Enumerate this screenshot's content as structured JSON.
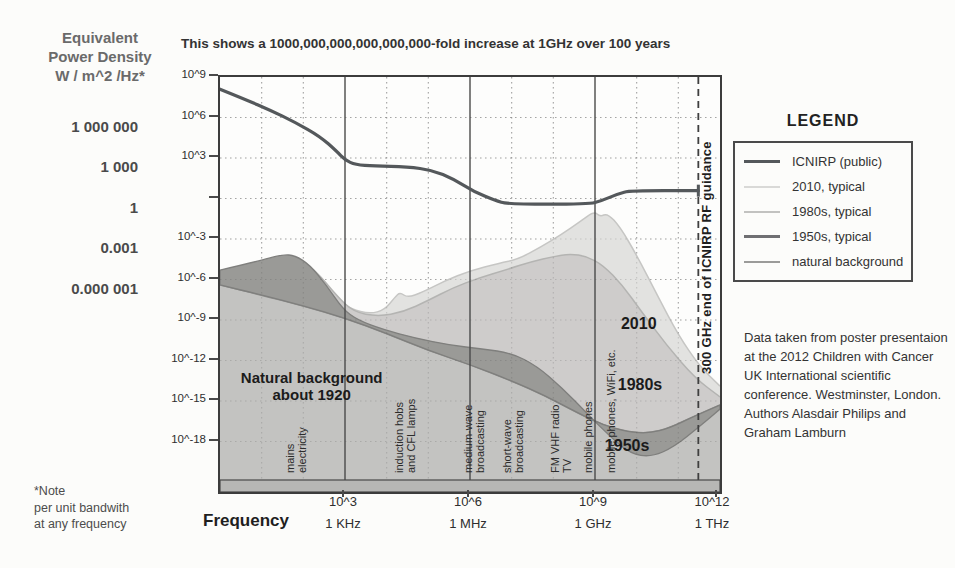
{
  "title": "This shows a 1000,000,000,000,000,000-fold increase at 1GHz over 100 years",
  "y_axis": {
    "title": "Equivalent\nPower Density\nW / m^2 /Hz*",
    "equivalent_values": [
      {
        "label": "1 000 000",
        "log_v": 6
      },
      {
        "label": "1 000",
        "log_v": 3
      },
      {
        "label": "1",
        "log_v": 0
      },
      {
        "label": "0.001",
        "log_v": -3
      },
      {
        "label": "0.000 001",
        "log_v": -6
      }
    ],
    "tick_labels": [
      {
        "label": "10^9",
        "log_v": 9
      },
      {
        "label": "10^6",
        "log_v": 6
      },
      {
        "label": "10^3",
        "log_v": 3
      },
      {
        "label": "",
        "log_v": 0
      },
      {
        "label": "10^-3",
        "log_v": -3
      },
      {
        "label": "10^-6",
        "log_v": -6
      },
      {
        "label": "10^-9",
        "log_v": -9
      },
      {
        "label": "10^-12",
        "log_v": -12
      },
      {
        "label": "10^-15",
        "log_v": -15
      },
      {
        "label": "10^-18",
        "log_v": -18
      }
    ]
  },
  "x_axis": {
    "label": "Frequency",
    "ticks": [
      {
        "exp": "10^3",
        "unit": "1 KHz",
        "log_f": 3
      },
      {
        "exp": "10^6",
        "unit": "1 MHz",
        "log_f": 6
      },
      {
        "exp": "10^9",
        "unit": "1 GHz",
        "log_f": 9
      },
      {
        "exp": "10^12",
        "unit": "1 THz",
        "log_f": 12
      }
    ]
  },
  "footnote": "*Note\nper unit bandwith\nat any frequency",
  "legend": {
    "title": "LEGEND",
    "entries": [
      {
        "label": "ICNIRP (public)",
        "color": "#54585b",
        "thickness": 3
      },
      {
        "label": "2010, typical",
        "color": "#d9d9d7",
        "thickness": 2
      },
      {
        "label": "1980s, typical",
        "color": "#c2c2c0",
        "thickness": 2
      },
      {
        "label": "1950s, typical",
        "color": "#6f6f72",
        "thickness": 3
      },
      {
        "label": "natural background",
        "color": "#9b9b99",
        "thickness": 2.5
      }
    ]
  },
  "source_note": "Data taken from poster presentaion at the 2012 Children with Cancer UK International scientific conference. Westminster, London. Authors Alasdair Philips and Graham Lamburn",
  "chart_data": {
    "type": "area",
    "title": "This shows a 1000,000,000,000,000,000-fold increase at 1GHz over 100 years",
    "xlabel": "Frequency (log10 Hz)",
    "ylabel": "Equivalent Power Density W / m^2 /Hz (log10)",
    "x_range": [
      0,
      12
    ],
    "y_range": [
      -21,
      9
    ],
    "grid": {
      "h_dotted_log_v": [
        6,
        3,
        0,
        -3,
        -6,
        -9,
        -12,
        -15,
        -18
      ],
      "v_dotted_log_f": [
        1,
        2,
        4,
        5,
        7,
        8,
        10,
        11
      ],
      "v_solid_log_f": [
        3,
        6,
        9
      ],
      "v_dashed_log_f": 11.48
    },
    "colors": {
      "icnirp": "#54585b",
      "fill_2010": "#e2e2e0",
      "edge_2010": "#c6c6c4",
      "fill_1980": "#cecccb",
      "edge_1980": "#b4b4b2",
      "fill_natural": "#c3c3c1",
      "edge_natural": "#8e8e8c",
      "fill_1950": "#9a9a97",
      "edge_1950": "#7f7f7d",
      "frame": "#3c3c3c",
      "axis_bar": "#b7b7b5",
      "grid_dot": "rgba(70,70,70,0.35)"
    },
    "series": [
      {
        "name": "2010, typical",
        "mode": "area",
        "points": [
          [
            0,
            -5.7
          ],
          [
            0.9,
            -5.0
          ],
          [
            1.55,
            -4.45
          ],
          [
            1.85,
            -4.55
          ],
          [
            2.3,
            -5.5
          ],
          [
            2.8,
            -7.4
          ],
          [
            3.15,
            -8.2
          ],
          [
            3.6,
            -8.55
          ],
          [
            3.95,
            -8.25
          ],
          [
            4.2,
            -7.3
          ],
          [
            4.32,
            -6.95
          ],
          [
            4.5,
            -7.35
          ],
          [
            4.85,
            -6.95
          ],
          [
            5.4,
            -6.1
          ],
          [
            6.0,
            -5.35
          ],
          [
            6.7,
            -4.8
          ],
          [
            7.15,
            -4.5
          ],
          [
            7.7,
            -3.6
          ],
          [
            8.2,
            -2.65
          ],
          [
            8.65,
            -1.7
          ],
          [
            8.98,
            -0.95
          ],
          [
            9.12,
            -1.35
          ],
          [
            9.3,
            -1.1
          ],
          [
            9.6,
            -2.1
          ],
          [
            10.0,
            -4.2
          ],
          [
            10.5,
            -7.2
          ],
          [
            11.0,
            -10.1
          ],
          [
            11.5,
            -12.4
          ],
          [
            12,
            -13.9
          ]
        ]
      },
      {
        "name": "1980s, typical",
        "mode": "area",
        "points": [
          [
            0,
            -5.5
          ],
          [
            0.9,
            -4.85
          ],
          [
            1.55,
            -4.3
          ],
          [
            1.85,
            -4.4
          ],
          [
            2.3,
            -5.35
          ],
          [
            2.8,
            -7.2
          ],
          [
            3.2,
            -8.4
          ],
          [
            3.8,
            -8.75
          ],
          [
            4.4,
            -8.4
          ],
          [
            5.0,
            -7.55
          ],
          [
            5.6,
            -6.6
          ],
          [
            6.2,
            -5.9
          ],
          [
            6.9,
            -5.25
          ],
          [
            7.5,
            -4.65
          ],
          [
            8.0,
            -4.3
          ],
          [
            8.4,
            -4.1
          ],
          [
            8.8,
            -4.28
          ],
          [
            9.2,
            -4.95
          ],
          [
            9.65,
            -6.4
          ],
          [
            10.1,
            -8.3
          ],
          [
            10.7,
            -10.8
          ],
          [
            11.4,
            -13.3
          ],
          [
            12,
            -14.7
          ]
        ]
      },
      {
        "name": "natural background",
        "mode": "area",
        "points": [
          [
            0,
            -6.4
          ],
          [
            1,
            -7.15
          ],
          [
            2,
            -7.95
          ],
          [
            3,
            -8.85
          ],
          [
            4,
            -10.0
          ],
          [
            5,
            -11.25
          ],
          [
            6,
            -12.3
          ],
          [
            7,
            -13.5
          ],
          [
            7.8,
            -14.6
          ],
          [
            8.6,
            -15.9
          ],
          [
            9.2,
            -16.8
          ],
          [
            9.8,
            -17.3
          ],
          [
            10.3,
            -17.4
          ],
          [
            10.8,
            -17.0
          ],
          [
            11.4,
            -16.1
          ],
          [
            12,
            -15.3
          ]
        ]
      },
      {
        "name": "1950s, typical",
        "mode": "band_vs_natural",
        "points": [
          [
            0,
            -5.3
          ],
          [
            0.85,
            -4.7
          ],
          [
            1.5,
            -4.15
          ],
          [
            1.8,
            -4.22
          ],
          [
            2.15,
            -4.9
          ],
          [
            2.55,
            -6.4
          ],
          [
            2.95,
            -8.2
          ],
          [
            3.3,
            -9.0
          ],
          [
            3.9,
            -9.7
          ],
          [
            4.7,
            -10.35
          ],
          [
            5.5,
            -10.85
          ],
          [
            6.3,
            -11.15
          ],
          [
            7.0,
            -11.45
          ],
          [
            7.6,
            -12.4
          ],
          [
            8.2,
            -14.0
          ],
          [
            8.8,
            -15.9
          ],
          [
            9.35,
            -17.6
          ],
          [
            9.85,
            -18.9
          ],
          [
            10.35,
            -19.15
          ],
          [
            10.9,
            -18.4
          ],
          [
            11.5,
            -16.9
          ],
          [
            12,
            -15.6
          ]
        ]
      },
      {
        "name": "ICNIRP (public)",
        "mode": "line",
        "points": [
          [
            0,
            8.1
          ],
          [
            0.6,
            7.35
          ],
          [
            1.2,
            6.55
          ],
          [
            1.8,
            5.65
          ],
          [
            2.4,
            4.6
          ],
          [
            2.8,
            3.5
          ],
          [
            3.0,
            2.85
          ],
          [
            3.25,
            2.5
          ],
          [
            3.7,
            2.4
          ],
          [
            4.5,
            2.35
          ],
          [
            5.1,
            2.1
          ],
          [
            5.6,
            1.45
          ],
          [
            6.1,
            0.5
          ],
          [
            6.6,
            -0.15
          ],
          [
            6.9,
            -0.42
          ],
          [
            8.85,
            -0.42
          ],
          [
            9.15,
            -0.18
          ],
          [
            9.55,
            0.35
          ],
          [
            9.85,
            0.58
          ],
          [
            11.48,
            0.58
          ]
        ]
      }
    ],
    "annotations": {
      "region_labels": [
        {
          "text": "2010",
          "log_f": 10.05,
          "log_v": -9.3
        },
        {
          "text": "1980s",
          "log_f": 10.08,
          "log_v": -13.8
        },
        {
          "text": "1950s",
          "log_f": 9.77,
          "log_v": -18.3
        }
      ],
      "natural_label": {
        "text": "Natural background\nabout 1920",
        "log_f": 2.2,
        "log_v": -13.9
      },
      "frequency_band_labels": [
        {
          "text": "mains\nelectricity",
          "log_f": 1.56
        },
        {
          "text": "induction hobs\nand CFL lamps",
          "log_f": 4.18
        },
        {
          "text": "medium-wave\nbroadcasting",
          "log_f": 5.83
        },
        {
          "text": "short-wave\nbroadcasting",
          "log_f": 6.77
        },
        {
          "text": "FM VHF radio\nTV",
          "log_f": 7.92
        },
        {
          "text": "mobile phones",
          "log_f": 8.71
        },
        {
          "text": "mobile phones, WiFi, etc.",
          "log_f": 9.26
        }
      ],
      "dashed_line_label": {
        "text": "300 GHz end of ICNIRP RF guidance",
        "log_f": 11.54
      }
    }
  }
}
